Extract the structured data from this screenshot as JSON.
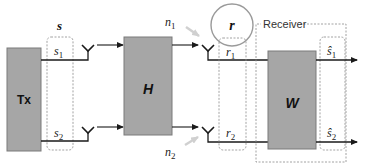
{
  "diagram": {
    "type": "MIMO system block diagram",
    "blocks": {
      "tx": {
        "label": "Tx"
      },
      "channel": {
        "label": "H"
      },
      "receiver_filter": {
        "label": "W"
      },
      "receiver_group": {
        "label": "Receiver"
      }
    },
    "signals": {
      "transmit_vector": {
        "label": "s"
      },
      "s1": {
        "base": "s",
        "sub": "1"
      },
      "s2": {
        "base": "s",
        "sub": "2"
      },
      "n1": {
        "base": "n",
        "sub": "1"
      },
      "n2": {
        "base": "n",
        "sub": "2"
      },
      "receive_vector": {
        "label": "r"
      },
      "r1": {
        "base": "r",
        "sub": "1"
      },
      "r2": {
        "base": "r",
        "sub": "2"
      },
      "s1_hat": {
        "base": "ŝ",
        "sub": "1"
      },
      "s2_hat": {
        "base": "ŝ",
        "sub": "2"
      }
    },
    "colors": {
      "block_fill": "#a6a6a6",
      "block_stroke": "#7a7a7a",
      "line": "#1a1a1a",
      "dashed": "#8c8c8c",
      "noise_arrow": "#cfcfcf",
      "circle": "#9a9a9a"
    }
  }
}
